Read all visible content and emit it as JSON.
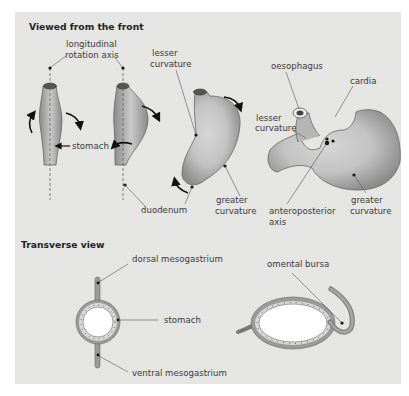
{
  "sections": {
    "front": {
      "title": "Viewed from the front",
      "labels": {
        "axis_line1": "longitudinal",
        "axis_line2": "rotation axis",
        "stomach": "stomach",
        "duodenum": "duodenum",
        "lesser1_line1": "lesser",
        "lesser1_line2": "curvature",
        "greater1_line1": "greater",
        "greater1_line2": "curvature",
        "oesophagus": "oesophagus",
        "cardia": "cardia",
        "lesser2_line1": "lesser",
        "lesser2_line2": "curvature",
        "ap_line1": "anteroposterior",
        "ap_line2": "axis",
        "greater2_line1": "greater",
        "greater2_line2": "curvature"
      }
    },
    "transverse": {
      "title": "Transverse view",
      "labels": {
        "dorsal": "dorsal mesogastrium",
        "stomach": "stomach",
        "ventral": "ventral mesogastrium",
        "bursa": "omental bursa"
      }
    }
  },
  "colors": {
    "panel": "#e5e5e3",
    "organ_dark": "#8e8e8e",
    "organ_light": "#c8c8c8",
    "line": "#555555"
  }
}
